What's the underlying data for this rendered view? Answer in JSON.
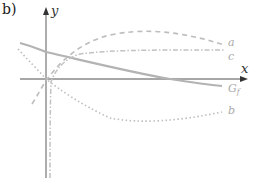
{
  "figure": {
    "part_label": "b)",
    "axes": {
      "x_label": "x",
      "y_label": "y"
    },
    "curves": [
      {
        "id": "G_f",
        "label": "G",
        "subscript": "f",
        "style": "solid",
        "color": "#b3b3b3"
      },
      {
        "id": "a",
        "label": "a",
        "style": "dashed",
        "color": "#bdbdbd"
      },
      {
        "id": "c",
        "label": "c",
        "style": "dash-dot",
        "color": "#c2c2c2"
      },
      {
        "id": "b",
        "label": "b",
        "style": "dotted",
        "color": "#bdbdbd"
      }
    ],
    "colors": {
      "axis": "#8a8a8a",
      "text": "#333333"
    }
  }
}
